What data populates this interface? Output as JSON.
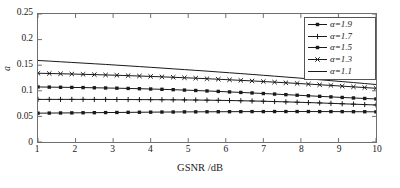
{
  "chart_data": {
    "type": "line",
    "title": "",
    "xlabel": "GSNR /dB",
    "ylabel": "a",
    "xlim": [
      1,
      10
    ],
    "ylim": [
      0,
      0.25
    ],
    "grid": false,
    "legend_position": "top-right",
    "xticks": [
      "1",
      "2",
      "3",
      "4",
      "5",
      "6",
      "7",
      "8",
      "9",
      "10"
    ],
    "yticks": [
      "0",
      "0.05",
      "0.1",
      "0.15",
      "0.2",
      "0.25"
    ],
    "x": [
      1,
      1.3,
      1.6,
      1.9,
      2.2,
      2.5,
      2.8,
      3.1,
      3.4,
      3.7,
      4,
      4.3,
      4.6,
      4.9,
      5.2,
      5.5,
      5.8,
      6.1,
      6.4,
      6.7,
      7,
      7.3,
      7.6,
      7.9,
      8.2,
      8.5,
      8.8,
      9.1,
      9.4,
      9.7,
      10
    ],
    "series": [
      {
        "name": "α=1.9",
        "marker": "square",
        "color": "#1a1a1a",
        "values": [
          0.1075,
          0.1072,
          0.1069,
          0.1066,
          0.1063,
          0.1059,
          0.1055,
          0.1051,
          0.1046,
          0.1041,
          0.1035,
          0.1029,
          0.1022,
          0.1014,
          0.1006,
          0.0997,
          0.0988,
          0.0978,
          0.0968,
          0.0958,
          0.0947,
          0.0936,
          0.0925,
          0.0914,
          0.0903,
          0.0892,
          0.0881,
          0.087,
          0.086,
          0.085,
          0.0841
        ]
      },
      {
        "name": "α=1.7",
        "marker": "plus",
        "color": "#1a1a1a",
        "values": [
          0.0832,
          0.0832,
          0.0832,
          0.0832,
          0.0832,
          0.0831,
          0.0831,
          0.083,
          0.0829,
          0.0828,
          0.0827,
          0.0826,
          0.0824,
          0.0822,
          0.082,
          0.0817,
          0.0814,
          0.081,
          0.0806,
          0.0801,
          0.0796,
          0.079,
          0.0784,
          0.0777,
          0.077,
          0.0763,
          0.0755,
          0.0747,
          0.0739,
          0.0731,
          0.0723
        ]
      },
      {
        "name": "α=1.5",
        "marker": "square",
        "color": "#1a1a1a",
        "values": [
          0.0563,
          0.0565,
          0.0567,
          0.0569,
          0.0571,
          0.0573,
          0.0575,
          0.0577,
          0.0579,
          0.0581,
          0.0583,
          0.0585,
          0.0586,
          0.0588,
          0.0589,
          0.059,
          0.0591,
          0.0592,
          0.0593,
          0.0594,
          0.0594,
          0.0595,
          0.0595,
          0.0595,
          0.0595,
          0.0594,
          0.0594,
          0.0593,
          0.0592,
          0.0591,
          0.0589
        ]
      },
      {
        "name": "α=1.3",
        "marker": "x",
        "color": "#1a1a1a",
        "values": [
          0.1343,
          0.1338,
          0.1333,
          0.1328,
          0.1322,
          0.1316,
          0.131,
          0.1303,
          0.1296,
          0.1289,
          0.1281,
          0.1273,
          0.1264,
          0.1255,
          0.1246,
          0.1236,
          0.1226,
          0.1215,
          0.1204,
          0.1193,
          0.1181,
          0.1169,
          0.1157,
          0.1144,
          0.1131,
          0.1118,
          0.1105,
          0.1091,
          0.1077,
          0.1063,
          0.1049
        ]
      },
      {
        "name": "α=1.1",
        "marker": "none",
        "color": "#1a1a1a",
        "values": [
          0.1592,
          0.158,
          0.1567,
          0.1554,
          0.1541,
          0.1528,
          0.1515,
          0.1501,
          0.1487,
          0.1473,
          0.1459,
          0.1444,
          0.1429,
          0.1414,
          0.1399,
          0.1384,
          0.1368,
          0.1352,
          0.1336,
          0.132,
          0.1303,
          0.1286,
          0.1269,
          0.1252,
          0.1234,
          0.1216,
          0.1198,
          0.118,
          0.1161,
          0.1142,
          0.1123
        ]
      }
    ]
  },
  "legend": {
    "entries": [
      {
        "label": "α=1.9"
      },
      {
        "label": "α=1.7"
      },
      {
        "label": "α=1.5"
      },
      {
        "label": "α=1.3"
      },
      {
        "label": "α=1.1"
      }
    ]
  },
  "axes": {
    "x_title": "GSNR /dB",
    "y_title": "a"
  }
}
